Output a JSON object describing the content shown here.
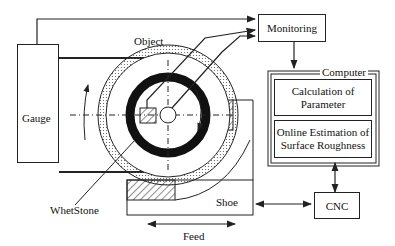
{
  "diagram": {
    "labels": {
      "object": "Object",
      "gauge": "Gauge",
      "monitoring": "Monitoring",
      "computer": "Computer",
      "calculation_line1": "Calculation of",
      "calculation_line2": "Parameter",
      "online_line1": "Online Estimation of",
      "online_line2": "Surface Roughness",
      "whetstone": "WhetStone",
      "shoe": "Shoe",
      "cnc": "CNC",
      "feed": "Feed"
    },
    "colors": {
      "line": "#222222",
      "background": "#ffffff"
    }
  }
}
